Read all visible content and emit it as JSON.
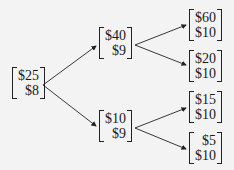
{
  "tree": {
    "root": {
      "top": "$25",
      "bottom": "$8"
    },
    "up": {
      "top": "$40",
      "bottom": "$9"
    },
    "down": {
      "top": "$10",
      "bottom": "$9"
    },
    "leaves": [
      {
        "top": "$60",
        "bottom": "$10"
      },
      {
        "top": "$20",
        "bottom": "$10"
      },
      {
        "top": "$15",
        "bottom": "$10"
      },
      {
        "top": "$5",
        "bottom": "$10"
      }
    ]
  },
  "colors": {
    "background": "#f3f3f3",
    "ink": "#1a1a1a"
  }
}
